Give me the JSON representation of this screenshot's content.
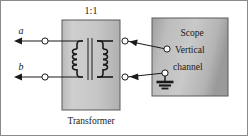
{
  "figure": {
    "width": 248,
    "height": 136,
    "background": "#ffffff"
  },
  "labels": {
    "ratio": "1:1",
    "terminal_a": "a",
    "terminal_b": "b",
    "transformer_caption": "Transformer",
    "scope_title": "Scope",
    "scope_input_line1": "Vertical",
    "scope_input_line2": "channel"
  },
  "colors": {
    "ink": "#1a1a1a",
    "wire": "#1a1a1a",
    "block_fill_light": "#c8c8c8",
    "block_fill_dark": "#a6a6a6",
    "block_edge": "#5a5a5a",
    "frame": "#8a8a8a",
    "node_fill": "#ffffff"
  },
  "transformer": {
    "ratio": "1:1",
    "primary_turns": 4,
    "secondary_turns": 4,
    "body": {
      "x": 62,
      "y": 20,
      "width": 58,
      "height": 90
    },
    "terminals": [
      {
        "name": "primary-top",
        "x": 60,
        "y": 41
      },
      {
        "name": "primary-bottom",
        "x": 60,
        "y": 77
      },
      {
        "name": "secondary-top",
        "x": 128,
        "y": 41
      },
      {
        "name": "secondary-bottom",
        "x": 128,
        "y": 77
      }
    ]
  },
  "scope": {
    "title": "Scope",
    "body": {
      "x": 152,
      "y": 18,
      "width": 76,
      "height": 78
    },
    "terminals": [
      {
        "name": "vertical-input",
        "x": 166,
        "y": 49
      },
      {
        "name": "ground-input",
        "x": 164,
        "y": 73
      }
    ],
    "ground_symbol": "earth-ground"
  },
  "input_terminals": [
    {
      "label": "a",
      "node_x": 45,
      "node_y": 41,
      "arrow_x": 16,
      "arrow_y": 41
    },
    {
      "label": "b",
      "node_x": 45,
      "node_y": 77,
      "arrow_x": 16,
      "arrow_y": 77
    }
  ]
}
